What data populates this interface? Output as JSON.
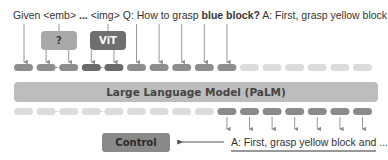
{
  "prompt": {
    "segments": [
      {
        "text": "Given ",
        "weight": "normal"
      },
      {
        "text": "<emb>",
        "weight": "normal"
      },
      {
        "text": " ... ",
        "weight": "bold"
      },
      {
        "text": "<img>",
        "weight": "normal"
      },
      {
        "text": " Q: How to grasp ",
        "weight": "normal"
      },
      {
        "text": "blue block?",
        "weight": "bold"
      },
      {
        "text": " A: First, grasp yellow block",
        "weight": "normal"
      }
    ]
  },
  "encoders": [
    {
      "label": "?",
      "color": "#a9a9a9"
    },
    {
      "label": "ViT",
      "color": "#6f6f6f"
    }
  ],
  "llm": {
    "label": "Large Language Model (PaLM)",
    "color": "#bdbdbd"
  },
  "control": {
    "label": "Control",
    "color": "#8a8a8a"
  },
  "output": {
    "text": "A: First, grasp yellow block and ..."
  },
  "colors": {
    "token_input": "#8e8e8e",
    "token_image": "#6a6a6a",
    "token_faded": "#dcdcdc",
    "token_output": "#8a8a8a",
    "arrow": "#8c8c8c",
    "text": "#333333"
  },
  "input_tokens": [
    {
      "kind": "input"
    },
    {
      "kind": "input"
    },
    {
      "kind": "input"
    },
    {
      "kind": "image"
    },
    {
      "kind": "image"
    },
    {
      "kind": "input"
    },
    {
      "kind": "input"
    },
    {
      "kind": "input"
    },
    {
      "kind": "input"
    },
    {
      "kind": "input"
    },
    {
      "kind": "faded"
    },
    {
      "kind": "faded"
    },
    {
      "kind": "faded"
    },
    {
      "kind": "faded"
    },
    {
      "kind": "faded"
    },
    {
      "kind": "faded"
    }
  ],
  "output_tokens": [
    {
      "kind": "faded"
    },
    {
      "kind": "faded"
    },
    {
      "kind": "faded"
    },
    {
      "kind": "faded"
    },
    {
      "kind": "faded"
    },
    {
      "kind": "faded"
    },
    {
      "kind": "faded"
    },
    {
      "kind": "faded"
    },
    {
      "kind": "faded"
    },
    {
      "kind": "output"
    },
    {
      "kind": "output"
    },
    {
      "kind": "output"
    },
    {
      "kind": "output"
    },
    {
      "kind": "output"
    },
    {
      "kind": "output"
    },
    {
      "kind": "output"
    }
  ]
}
